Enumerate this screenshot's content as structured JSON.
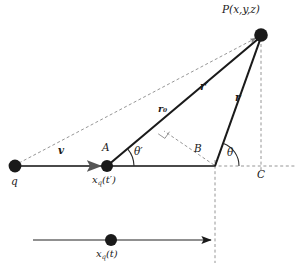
{
  "figure": {
    "kind": "physics-vector-diagram",
    "background_color": "#ffffff",
    "stroke_color": "#1a1a1a",
    "dash_color": "#8a8a8a"
  },
  "points": [
    {
      "id": "q",
      "label": "q",
      "x": 15,
      "y": 166,
      "radius": 6.5,
      "label_dx": -4,
      "label_dy": 10
    },
    {
      "id": "A",
      "label": "A",
      "x": 107,
      "y": 166,
      "radius": 6.0,
      "label_dx": -4,
      "label_dy": -22
    },
    {
      "id": "P",
      "label": "P(x,y,z)",
      "x": 261,
      "y": 35,
      "radius": 7.0,
      "label_dx": -22,
      "label_dy": -24
    },
    {
      "id": "xqt",
      "label": "x_q(t)",
      "x": 111,
      "y": 240,
      "radius": 6.0,
      "label_dx": -14,
      "label_dy": 10
    }
  ],
  "labels": {
    "P": "P(x,y,z)",
    "q": "q",
    "A": "A",
    "B": "B",
    "C": "C",
    "v": "v",
    "theta": "θ",
    "theta_prime": "θ′",
    "r": "r",
    "r_prime": "r′",
    "r_zero": "r₀",
    "x_q_of_t_retarded_base": "x",
    "x_q_of_t_retarded_sub": "q",
    "x_q_of_t_retarded_arg": "(t′)",
    "x_q_of_t_base": "x",
    "x_q_of_t_sub": "q",
    "x_q_of_t_arg": "(t)"
  },
  "geometry": {
    "axis_line": {
      "x1": 15,
      "y1": 166,
      "x2": 215,
      "y2": 166
    },
    "axis_dashed_ext": {
      "x1": 215,
      "y1": 166,
      "x2": 295,
      "y2": 166
    },
    "vector_r_prime": {
      "x1": 107,
      "y1": 166,
      "x2": 259,
      "y2": 38
    },
    "vector_r": {
      "x1": 215,
      "y1": 166,
      "x2": 261,
      "y2": 39
    },
    "dashed_q_to_P": {
      "x1": 18,
      "y1": 164,
      "x2": 257,
      "y2": 37
    },
    "dashed_P_to_C": {
      "x1": 261,
      "y1": 44,
      "x2": 261,
      "y2": 172
    },
    "dashed_B_vertical": {
      "x1": 215,
      "y1": 166,
      "x2": 215,
      "y2": 262
    },
    "dashed_perp_B": {
      "x1": 215,
      "y1": 166,
      "x2": 165,
      "y2": 131
    },
    "bottom_arrow": {
      "x1": 33,
      "y1": 240,
      "x2": 212,
      "y2": 240
    },
    "v_arrow": {
      "x1": 22,
      "y1": 166,
      "x2": 104,
      "y2": 166
    },
    "angle_theta_prime": {
      "cx": 107,
      "cy": 166,
      "radius": 26,
      "start_deg": 0,
      "end_deg": 40
    },
    "angle_theta": {
      "cx": 215,
      "cy": 166,
      "radius": 24,
      "start_deg": 0,
      "end_deg": 70
    },
    "right_angle_mark": {
      "x": 163,
      "y": 130,
      "size": 7
    }
  },
  "label_positions": {
    "P": {
      "x": 222,
      "y": 8
    },
    "q": {
      "x": 11,
      "y": 178
    },
    "A": {
      "x": 103,
      "y": 144
    },
    "B": {
      "x": 194,
      "y": 146
    },
    "C": {
      "x": 258,
      "y": 172
    },
    "v": {
      "x": 58,
      "y": 147
    },
    "theta": {
      "x": 227,
      "y": 150
    },
    "theta_prime": {
      "x": 136,
      "y": 149
    },
    "r": {
      "x": 234,
      "y": 96
    },
    "r_prime": {
      "x": 200,
      "y": 85
    },
    "r_zero": {
      "x": 158,
      "y": 107
    },
    "x_q_t_prime": {
      "x": 92,
      "y": 177
    },
    "x_q_t": {
      "x": 96,
      "y": 251
    }
  }
}
